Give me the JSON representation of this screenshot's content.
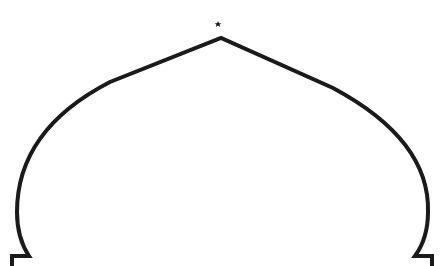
{
  "illustration": {
    "subject": "mosque dome outline",
    "stroke_color": "#1a1a1a",
    "background_color": "#ffffff",
    "finial": {
      "symbols": [
        "crescent",
        "star"
      ]
    }
  },
  "corner_mark": {
    "text": ""
  }
}
